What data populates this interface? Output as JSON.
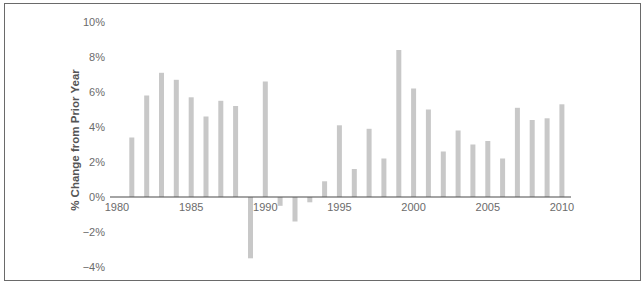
{
  "chart_data": {
    "type": "bar",
    "title": "",
    "xlabel": "",
    "ylabel": "% Change from Prior Year",
    "ylim": [
      -4,
      10
    ],
    "yticks": [
      "10%",
      "8%",
      "6%",
      "4%",
      "2%",
      "0%",
      "-2%",
      "-4%"
    ],
    "ytick_values": [
      10,
      8,
      6,
      4,
      2,
      0,
      -2,
      -4
    ],
    "xticks": [
      "1980",
      "1985",
      "1990",
      "1995",
      "2000",
      "2005",
      "2010"
    ],
    "xtick_values": [
      1980,
      1985,
      1990,
      1995,
      2000,
      2005,
      2010
    ],
    "grid": false,
    "legend": null,
    "bar_color": "#c8c8c8",
    "categories": [
      1981,
      1982,
      1983,
      1984,
      1985,
      1986,
      1987,
      1988,
      1989,
      1990,
      1991,
      1992,
      1993,
      1994,
      1995,
      1996,
      1997,
      1998,
      1999,
      2000,
      2001,
      2002,
      2003,
      2004,
      2005,
      2006,
      2007,
      2008,
      2009,
      2010
    ],
    "values": [
      3.4,
      5.8,
      7.1,
      6.7,
      5.7,
      4.6,
      5.5,
      5.2,
      -3.5,
      6.6,
      -0.5,
      -1.4,
      -0.3,
      0.9,
      4.1,
      1.6,
      3.9,
      2.2,
      8.4,
      6.2,
      5.0,
      2.6,
      3.8,
      3.0,
      3.2,
      2.2,
      5.1,
      4.4,
      4.5,
      5.3
    ]
  }
}
